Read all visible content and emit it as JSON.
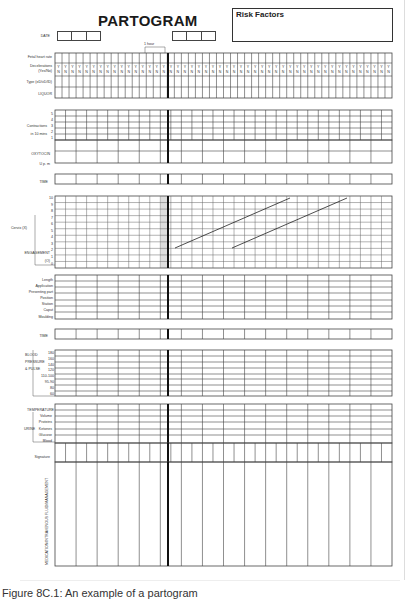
{
  "header": {
    "title": "PARTOGRAM",
    "risk_factors_label": "Risk Factors",
    "date_label": "DATE",
    "one_hour_marker": "1 hour"
  },
  "rows": {
    "fetal_heart_rate": "Fetal heart rate",
    "decelerations": "Decelerations",
    "decelerations_sub": "(Yes/No)",
    "type": "Type (eD/vD/lD)",
    "liquor": "LIQUOR",
    "contractions": "Contractions",
    "contractions_sub": "in 10 mins",
    "contraction_scale": [
      "5",
      "4",
      "3",
      "2",
      "1"
    ],
    "oxytocin": "OXYTOCIN",
    "oxytocin_units": "U/L/drops/min",
    "oxytocin_sub": "U p. m",
    "time": "TIME",
    "cervix": "Cervix (X)",
    "engagement": "ENGAGEMENT",
    "engagement_sub": "(O)",
    "cervix_scale": [
      "10",
      "9",
      "8",
      "7",
      "6",
      "5",
      "4",
      "3",
      "2",
      "1",
      "0"
    ],
    "assessment": [
      "Length",
      "Application",
      "Presenting part",
      "Position",
      "Station",
      "Caput",
      "Moulding"
    ],
    "time2": "TIME",
    "bp": "BLOOD",
    "bp2": "PRESSURE",
    "bp3": "& PULSE",
    "bp_scale": [
      "180",
      "160",
      "140",
      "120",
      "110-100",
      "95-90",
      "80",
      "60"
    ],
    "bp_left_marks": [
      "110-",
      "95-"
    ],
    "temperature": "TEMPERATURE",
    "urine": "URINE",
    "urine_rows": [
      "Volume",
      "Proteins",
      "Ketones",
      "Glucose",
      "Blood"
    ],
    "signature": "Signature",
    "medication": "MEDICATION/INTRAVENOUS FLUID/MANAGEMENT",
    "yes_no": [
      "Y",
      "N"
    ]
  },
  "caption": "Figure 8C.1: An example of a partogram"
}
